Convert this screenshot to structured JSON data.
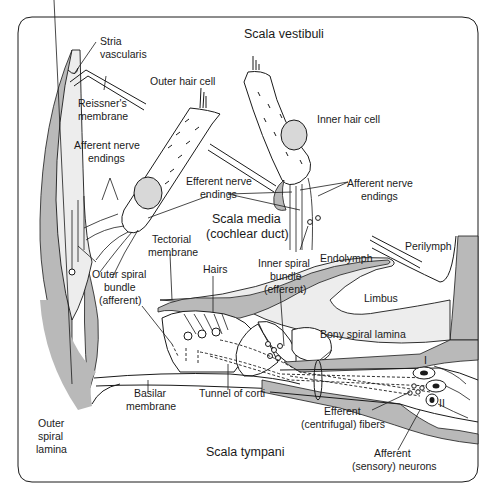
{
  "diagram": {
    "regions": {
      "scala_vestibuli": "Scala vestibuli",
      "scala_media_1": "Scala media",
      "scala_media_2": "(cochlear duct)",
      "scala_tympani": "Scala tympani"
    },
    "labels": {
      "stria_1": "Stria",
      "stria_2": "vascularis",
      "reissner_1": "Reissner's",
      "reissner_2": "membrane",
      "outer_hair_cell": "Outer hair cell",
      "inner_hair_cell": "Inner hair cell",
      "afferent_left_1": "Afferent nerve",
      "afferent_left_2": "endings",
      "efferent_center_1": "Efferent nerve",
      "efferent_center_2": "endings",
      "afferent_right_1": "Afferent nerve",
      "afferent_right_2": "endings",
      "tectorial_1": "Tectorial",
      "tectorial_2": "membrane",
      "hairs": "Hairs",
      "inner_spiral_1": "Inner spiral",
      "inner_spiral_2": "bundle",
      "inner_spiral_3": "(efferent)",
      "endolymph": "Endolymph",
      "perilymph": "Perilymph",
      "limbus": "Limbus",
      "outer_spiral_1": "Outer spiral",
      "outer_spiral_2": "bundle",
      "outer_spiral_3": "(afferent)",
      "bony_spiral_lamina": "Bony spiral lamina",
      "basilar_1": "Basilar",
      "basilar_2": "membrane",
      "tunnel_of_corti": "Tunnel of corti",
      "outer_lamina_1": "Outer",
      "outer_lamina_2": "spiral",
      "outer_lamina_3": "lamina",
      "efferent_fibers_1": "Efferent",
      "efferent_fibers_2": "(centrifugal) fibers",
      "afferent_neurons_1": "Afferent",
      "afferent_neurons_2": "(sensory) neurons",
      "neuron_type_1": "I",
      "neuron_type_2": "II"
    },
    "colors": {
      "bone_grey": "#b9b9b9",
      "line": "#1a1a1a",
      "background": "#ffffff"
    }
  }
}
